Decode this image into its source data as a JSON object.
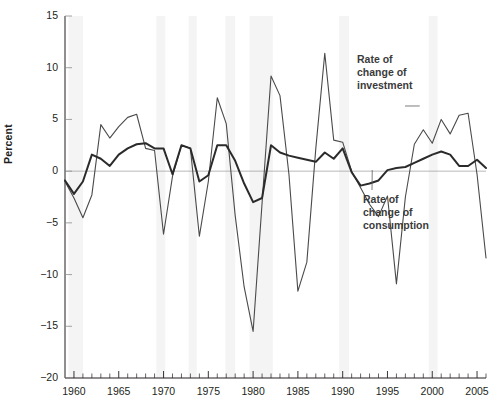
{
  "chart_data": {
    "type": "line",
    "title": "",
    "subtitle": "",
    "xlabel": "",
    "ylabel": "Percent",
    "xlim": [
      1959,
      2006
    ],
    "ylim": [
      -20,
      15
    ],
    "ytick_labels": [
      "15",
      "10",
      "5",
      "0",
      "-5",
      "-10",
      "-15",
      "-20"
    ],
    "ytick_values": [
      15,
      10,
      5,
      0,
      -5,
      -10,
      -15,
      -20
    ],
    "xtick_labels": [
      "1960",
      "1965",
      "1970",
      "1975",
      "1980",
      "1985",
      "1990",
      "1995",
      "2000",
      "2005"
    ],
    "xtick_values": [
      1960,
      1965,
      1970,
      1975,
      1980,
      1985,
      1990,
      1995,
      2000,
      2005
    ],
    "minor_tick_interval": 1,
    "grid": false,
    "zero_line": true,
    "legend_position": "inline-annotations",
    "annotations": [
      {
        "id": "investment",
        "text_lines": [
          "Rate of",
          "change of",
          "investment"
        ],
        "points_to_year": 1998,
        "points_to_value": 6.0
      },
      {
        "id": "consumption",
        "text_lines": [
          "Rate of",
          "change of",
          "consumption"
        ],
        "points_to_year": 1993,
        "points_to_value": 0.2
      }
    ],
    "x": [
      1959,
      1960,
      1961,
      1962,
      1963,
      1964,
      1965,
      1966,
      1967,
      1968,
      1969,
      1970,
      1971,
      1972,
      1973,
      1974,
      1975,
      1976,
      1977,
      1978,
      1979,
      1980,
      1981,
      1982,
      1983,
      1984,
      1985,
      1986,
      1987,
      1988,
      1989,
      1990,
      1991,
      1992,
      1993,
      1994,
      1995,
      1996,
      1997,
      1998,
      1999,
      2000,
      2001,
      2002,
      2003,
      2004,
      2005,
      2006
    ],
    "series": [
      {
        "name": "Rate of change of investment",
        "color": "#4a4a4a",
        "width": 1.1,
        "values": [
          -1.0,
          -2.6,
          -4.5,
          -2.3,
          4.5,
          3.2,
          4.3,
          5.2,
          5.5,
          2.2,
          2.0,
          -6.1,
          -0.5,
          2.5,
          2.2,
          -6.3,
          -1.0,
          7.1,
          4.6,
          -4.3,
          -11.2,
          -15.5,
          -3.1,
          9.2,
          7.3,
          -0.3,
          -11.6,
          -8.8,
          2.2,
          11.4,
          3.0,
          2.8,
          0.0,
          -1.6,
          -3.2,
          -4.4,
          -2.4,
          -10.9,
          -2.5,
          2.6,
          4.0,
          2.7,
          5.0,
          3.6,
          5.4,
          5.6,
          -0.3,
          -8.4
        ]
      },
      {
        "name": "Rate of change of consumption",
        "color": "#2b2b2b",
        "width": 2.0,
        "values": [
          -0.9,
          -2.2,
          -1.0,
          1.6,
          1.2,
          0.5,
          1.6,
          2.2,
          2.6,
          2.7,
          2.2,
          2.2,
          -0.3,
          2.5,
          2.2,
          -1.0,
          -0.4,
          2.5,
          2.5,
          1.0,
          -1.2,
          -3.0,
          -2.6,
          2.5,
          1.8,
          1.5,
          1.3,
          1.1,
          0.9,
          1.8,
          1.2,
          2.2,
          -0.1,
          -1.4,
          -1.2,
          -0.9,
          0.1,
          0.3,
          0.4,
          0.8,
          1.2,
          1.6,
          1.9,
          1.6,
          0.5,
          0.5,
          1.1,
          0.3
        ]
      }
    ],
    "recession_bands": [
      {
        "start": 1959.4,
        "end": 1961.0
      },
      {
        "start": 1969.2,
        "end": 1970.2
      },
      {
        "start": 1972.8,
        "end": 1973.7
      },
      {
        "start": 1976.9,
        "end": 1978.0
      },
      {
        "start": 1979.6,
        "end": 1982.2
      },
      {
        "start": 1989.6,
        "end": 1990.7
      },
      {
        "start": 1999.6,
        "end": 2000.6
      }
    ],
    "recession_band_color": "#f4f4f4"
  }
}
